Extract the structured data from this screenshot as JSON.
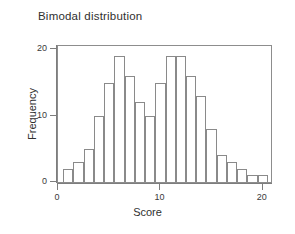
{
  "chart_data": {
    "type": "bar",
    "title": "Bimodal distribution",
    "xlabel": "Score",
    "ylabel": "Frequency",
    "categories": [
      1,
      2,
      3,
      4,
      5,
      6,
      7,
      8,
      9,
      10,
      11,
      12,
      13,
      14,
      15,
      16,
      17,
      18,
      19,
      20
    ],
    "values": [
      2,
      3,
      5,
      10,
      15,
      19,
      16,
      12,
      10,
      15,
      19,
      19,
      16,
      13,
      8,
      4,
      3,
      2,
      1,
      1
    ],
    "series": [
      {
        "name": "Frequency",
        "values": [
          2,
          3,
          5,
          10,
          15,
          19,
          16,
          12,
          10,
          15,
          19,
          19,
          16,
          13,
          8,
          4,
          3,
          2,
          1,
          1
        ]
      }
    ],
    "xlim": [
      0,
      20.8
    ],
    "ylim": [
      0,
      20.5
    ],
    "x_ticks": [
      0,
      10,
      20
    ],
    "y_ticks": [
      0,
      10,
      20
    ],
    "x_tick_labels": [
      "0",
      "10",
      "20"
    ],
    "y_tick_labels": [
      "0",
      "10",
      "20"
    ],
    "grid": false,
    "legend": false,
    "legend_position": "none",
    "bar_fill_color": "#ffffff",
    "bar_border_color": "#8a8a8a",
    "axis_color": "#7d7d7d",
    "text_color": "#2f2f2f",
    "background_color": "#ffffff",
    "frame": true
  }
}
